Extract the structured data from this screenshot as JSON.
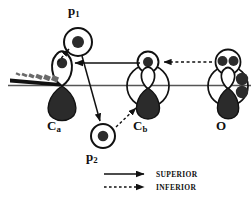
{
  "figure": {
    "type": "orbital-interaction-diagram",
    "title": "",
    "atoms": [
      {
        "id": "Ca",
        "label": "C",
        "subscript": "a",
        "x": 62,
        "y": 88,
        "orbital": "p-orbital",
        "top_lobe": "empty-with-dot",
        "bottom_lobe": "filled",
        "label_x": 47,
        "label_y": 119
      },
      {
        "id": "Cb",
        "label": "C",
        "subscript": "b",
        "x": 148,
        "y": 88,
        "orbital": "p-orbital-with-sigma-circle",
        "top_lobe": "empty",
        "bottom_lobe": "filled",
        "label_x": 133,
        "label_y": 119
      },
      {
        "id": "O",
        "label": "O",
        "subscript": "",
        "x": 228,
        "y": 88,
        "orbital": "p-orbital-with-lone-pairs",
        "top_lobe": "empty",
        "bottom_lobe": "filled",
        "label_x": 216,
        "label_y": 119
      }
    ],
    "probes": [
      {
        "id": "p1",
        "label": "p",
        "subscript": "1",
        "cx": 78,
        "cy": 42,
        "r": 14,
        "label_x": 68,
        "label_y": 4
      },
      {
        "id": "p2",
        "label": "p",
        "subscript": "2",
        "cx": 103,
        "cy": 136,
        "r": 12,
        "label_x": 86,
        "label_y": 150
      }
    ],
    "arrows": [
      {
        "from": "Cb",
        "to": "Ca",
        "style": "superior",
        "kind": "solid",
        "direction": "left"
      },
      {
        "from": "O",
        "to": "Cb",
        "style": "inferior",
        "kind": "dashed",
        "direction": "left"
      },
      {
        "from": "p1",
        "to": "p2",
        "style": "superior",
        "kind": "solid",
        "direction": "down-right"
      },
      {
        "from": "Ca",
        "to": "p1",
        "style": "inferior",
        "kind": "dashed",
        "direction": "up-left"
      },
      {
        "from": "p2",
        "to": "Cb",
        "style": "inferior",
        "kind": "dashed",
        "direction": "up-right"
      }
    ],
    "bonds": [
      {
        "type": "backbone-line",
        "from_x": 8,
        "to_x": 251,
        "y": 85
      },
      {
        "type": "hashed-wedge",
        "from": "Ca",
        "direction": "up-left"
      },
      {
        "type": "solid-wedge",
        "from": "Ca",
        "direction": "down-left"
      }
    ],
    "legend": [
      {
        "key": "superior",
        "label": "SUPERIOR",
        "line": "solid"
      },
      {
        "key": "inferior",
        "label": "INFERIOR",
        "line": "dashed"
      }
    ],
    "colors": {
      "stroke": "#111111",
      "fill_dark": "#2b2b2b",
      "background": "#ffffff",
      "backbone": "#555555"
    }
  }
}
